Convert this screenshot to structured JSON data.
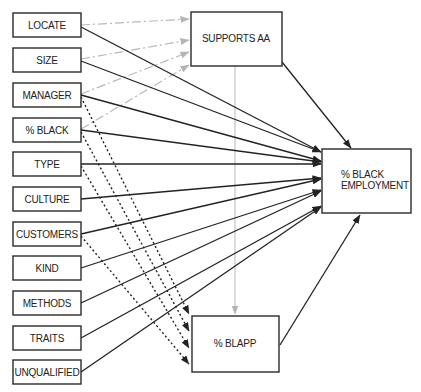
{
  "diagram": {
    "type": "path-model",
    "predictors": [
      {
        "id": "locate",
        "label": "LOCATE"
      },
      {
        "id": "size",
        "label": "SIZE"
      },
      {
        "id": "manager",
        "label": "MANAGER"
      },
      {
        "id": "pct_black",
        "label": "% BLACK"
      },
      {
        "id": "type",
        "label": "TYPE"
      },
      {
        "id": "culture",
        "label": "CULTURE"
      },
      {
        "id": "customers",
        "label": "CUSTOMERS"
      },
      {
        "id": "kind",
        "label": "KIND"
      },
      {
        "id": "methods",
        "label": "METHODS"
      },
      {
        "id": "traits",
        "label": "TRAITS"
      },
      {
        "id": "unqualified",
        "label": "UNQUALIFIED"
      }
    ],
    "mediators": {
      "supports_aa": {
        "label": "SUPPORTS AA"
      },
      "pct_blapp": {
        "label": "% BLAPP"
      }
    },
    "outcome": {
      "label_line1": "% BLACK",
      "label_line2": "EMPLOYMENT"
    },
    "edges": {
      "to_supports_aa_dashdot_gray": [
        "LOCATE",
        "SIZE",
        "MANAGER",
        "% BLACK"
      ],
      "to_blapp_dotted": [
        "MANAGER",
        "% BLACK",
        "TYPE",
        "CUSTOMERS"
      ],
      "to_outcome_solid": [
        "LOCATE",
        "SIZE",
        "MANAGER",
        "% BLACK",
        "TYPE",
        "CULTURE",
        "CUSTOMERS",
        "KIND",
        "METHODS",
        "TRAITS",
        "UNQUALIFIED",
        "SUPPORTS AA",
        "% BLAPP"
      ],
      "supports_aa_to_blapp_gray": true
    },
    "colors": {
      "solid": "#222222",
      "dashdot": "#b8b8b8",
      "vertical_link": "#bdbdbd"
    }
  }
}
